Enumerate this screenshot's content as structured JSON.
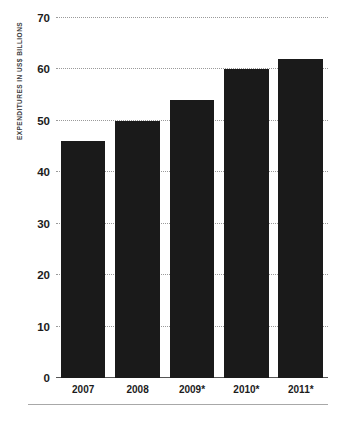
{
  "chart_data": {
    "type": "bar",
    "title": "",
    "subtitle": "",
    "xlabel": "",
    "ylabel": "EXPENDITURES IN US$ BILLIONS",
    "categories": [
      "2007",
      "2008",
      "2009*",
      "2010*",
      "2011*"
    ],
    "values": [
      46,
      50,
      54,
      60,
      62
    ],
    "series": [
      {
        "name": "Expenditures",
        "values": [
          46,
          50,
          54,
          60,
          62
        ]
      }
    ],
    "ylim": [
      0,
      70
    ],
    "yticks": [
      0,
      10,
      20,
      30,
      40,
      50,
      60,
      70
    ],
    "ytick_labels": [
      "0",
      "10",
      "20",
      "30",
      "40",
      "50",
      "60",
      "70"
    ],
    "grid": true,
    "grid_style": "dotted-horizontal",
    "legend": false,
    "legend_position": "none",
    "annotations": [
      "* denotes projected/estimated values"
    ],
    "colors": {
      "bar": "#1a1a1a",
      "grid": "#9a9a9a",
      "axis": "#555555",
      "text": "#1c1c1c",
      "axis_title": "#3c3c3c",
      "background": "#ffffff",
      "rule": "#a8a8a8"
    }
  }
}
